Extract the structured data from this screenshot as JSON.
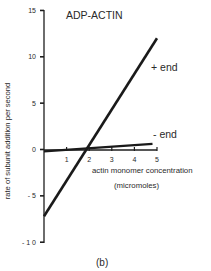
{
  "chart_data": {
    "type": "line",
    "title": "ADP-ACTIN",
    "xlabel": "actin monomer concentration",
    "xlabel_units": "(micromoles)",
    "ylabel": "rate of subunit addition per second",
    "caption": "(b)",
    "xlim": [
      0,
      5
    ],
    "ylim": [
      -10,
      15
    ],
    "x_ticks": [
      "1",
      "2",
      "3",
      "4",
      "5"
    ],
    "y_ticks": [
      "15",
      "10",
      "5",
      "0",
      "- 5",
      "- 1 0"
    ],
    "grid": false,
    "legend_position": "inline labels",
    "series": [
      {
        "name": "+ end",
        "x": [
          0,
          5.0
        ],
        "y": [
          -7.2,
          12.0
        ]
      },
      {
        "name": "- end",
        "x": [
          0,
          4.8
        ],
        "y": [
          -0.2,
          0.6
        ]
      }
    ],
    "critical_concentration": 1.9
  }
}
